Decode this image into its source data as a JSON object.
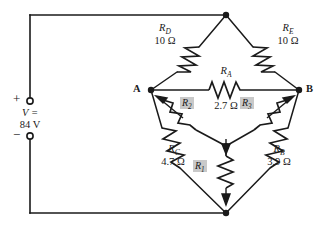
{
  "diagram": {
    "source": {
      "label_line1": "V =",
      "label_line2": "84 V",
      "plus_sign": "+",
      "minus_sign": "−",
      "voltage_value": "84",
      "voltage_unit": "V"
    },
    "nodes": [
      {
        "id": "node-a",
        "label": "A"
      },
      {
        "id": "node-b",
        "label": "B"
      }
    ],
    "resistors": [
      {
        "id": "rd",
        "name": "R",
        "subscript": "D",
        "value": "10 Ω",
        "shaded": false
      },
      {
        "id": "re",
        "name": "R",
        "subscript": "E",
        "value": "10 Ω",
        "shaded": false
      },
      {
        "id": "ra",
        "name": "R",
        "subscript": "A",
        "value": "2.7 Ω",
        "shaded": false
      },
      {
        "id": "rc",
        "name": "R",
        "subscript": "C",
        "value": "4.7 Ω",
        "shaded": false
      },
      {
        "id": "rb",
        "name": "R",
        "subscript": "B",
        "value": "3.9 Ω",
        "shaded": false
      },
      {
        "id": "r1",
        "name": "R",
        "subscript": "1",
        "value": "",
        "shaded": true
      },
      {
        "id": "r2",
        "name": "R",
        "subscript": "2",
        "value": "",
        "shaded": true
      },
      {
        "id": "r3",
        "name": "R",
        "subscript": "3",
        "value": "",
        "shaded": true
      }
    ],
    "colors": {
      "wire": "#1a1a1a",
      "background": "#ffffff",
      "shade": "#c9c9c9",
      "text": "#1a1a1a"
    }
  }
}
